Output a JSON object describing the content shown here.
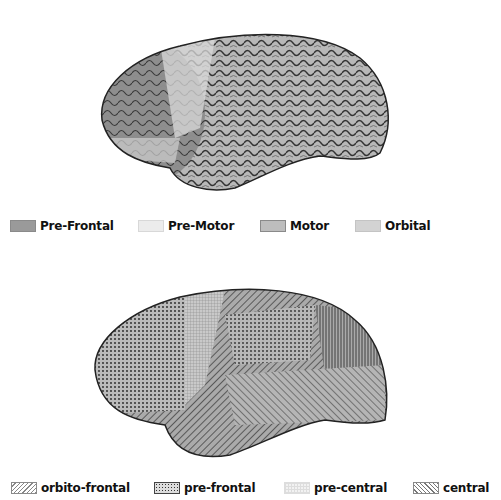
{
  "figure": {
    "top_panel": {
      "description": "Lateral brain surface rendering with shaded frontal subregions",
      "legend": [
        {
          "label": "Pre-Frontal",
          "swatch": "#9a9a9a"
        },
        {
          "label": "Pre-Motor",
          "swatch": "#ececec"
        },
        {
          "label": "Motor",
          "swatch": "#bdbdbd"
        },
        {
          "label": "Orbital",
          "swatch": "#d3d3d3"
        }
      ]
    },
    "bottom_panel": {
      "description": "Lateral brain surface rendering with hatch-patterned regions",
      "legend": [
        {
          "label": "orbito-frontal",
          "pattern": "diagonal-hatch"
        },
        {
          "label": "pre-frontal",
          "pattern": "dots"
        },
        {
          "label": "pre-central",
          "pattern": "grid"
        },
        {
          "label": "central",
          "pattern": "reverse-diagonal-hatch"
        }
      ]
    }
  }
}
